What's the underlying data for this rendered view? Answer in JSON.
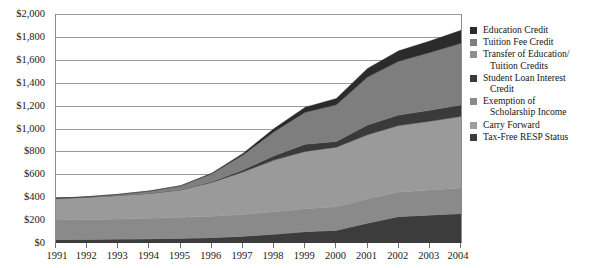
{
  "chart_data": {
    "type": "area",
    "stacked": true,
    "title": "",
    "xlabel": "",
    "ylabel": "",
    "ylim": [
      0,
      2000
    ],
    "ytick_step": 200,
    "grid": true,
    "legend_position": "right",
    "categories": [
      "1991",
      "1992",
      "1993",
      "1994",
      "1995",
      "1996",
      "1997",
      "1998",
      "1999",
      "2000",
      "2001",
      "2002",
      "2003",
      "2004"
    ],
    "ytick_labels": [
      "$2,000",
      "$1,800",
      "$1,600",
      "$1,400",
      "$1,200",
      "$1,000",
      "$800",
      "$600",
      "$400",
      "$200",
      "$0"
    ],
    "series": [
      {
        "name": "Tax-Free RESP Status",
        "color": "#3c3c3c",
        "values": [
          30,
          32,
          35,
          38,
          42,
          48,
          60,
          78,
          100,
          112,
          175,
          232,
          245,
          258
        ]
      },
      {
        "name": "Carry Forward",
        "color": "#9e9e9e",
        "values": [
          0,
          0,
          0,
          0,
          0,
          0,
          0,
          0,
          0,
          0,
          0,
          0,
          0,
          0
        ]
      },
      {
        "name": "Exemption of Scholarship Income",
        "color": "#8a8a8a",
        "values": [
          170,
          172,
          175,
          178,
          182,
          186,
          190,
          196,
          200,
          205,
          210,
          214,
          218,
          222
        ]
      },
      {
        "name": "Student Loan Interest Credit",
        "color": "#9a9a9a",
        "values": [
          190,
          196,
          205,
          218,
          240,
          295,
          370,
          450,
          500,
          520,
          560,
          580,
          600,
          625
        ]
      },
      {
        "name": "Transfer of Education/Tuition Credits",
        "color": "#3a3a3a",
        "values": [
          0,
          0,
          0,
          0,
          0,
          6,
          18,
          38,
          62,
          50,
          85,
          92,
          96,
          100
        ]
      },
      {
        "name": "Tuition Fee Credit",
        "color": "#7e7e7e",
        "values": [
          0,
          4,
          10,
          20,
          36,
          70,
          130,
          210,
          280,
          320,
          420,
          470,
          505,
          540
        ]
      },
      {
        "name": "Education Credit",
        "color": "#2b2b2b",
        "values": [
          0,
          0,
          0,
          0,
          0,
          5,
          14,
          28,
          44,
          55,
          75,
          90,
          100,
          112
        ]
      }
    ],
    "totals": [
      390,
      404,
      425,
      454,
      500,
      610,
      782,
      1000,
      1186,
      1262,
      1525,
      1678,
      1764,
      1857
    ]
  },
  "legend": {
    "items": [
      {
        "label": "Education Credit",
        "color": "#2b2b2b"
      },
      {
        "label": "Tuition Fee Credit",
        "color": "#7e7e7e"
      },
      {
        "label": "Transfer of Education/",
        "label2": "Tuition Credits",
        "color": "#8f8f8f"
      },
      {
        "label": "Student Loan Interest",
        "label2": "Credit",
        "color": "#3a3a3a"
      },
      {
        "label": "Exemption of",
        "label2": "Scholarship Income",
        "color": "#8a8a8a"
      },
      {
        "label": "Carry Forward",
        "color": "#9e9e9e"
      },
      {
        "label": "Tax-Free RESP Status",
        "color": "#3c3c3c"
      }
    ]
  },
  "colors": {
    "gridline": "#9a9a9a",
    "axis": "#4a4a4a",
    "plot_border": "#8c8c8c",
    "text": "#1a1a1a",
    "background": "#ffffff"
  }
}
